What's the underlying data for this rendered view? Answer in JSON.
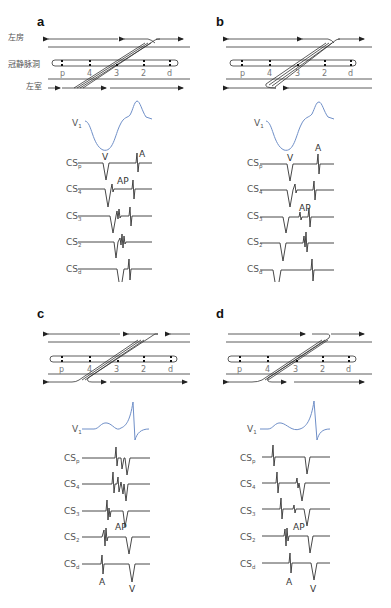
{
  "colors": {
    "v1_trace": "#6f8fc8",
    "trace": "#333333",
    "line": "#555555",
    "label": "#555555"
  },
  "anatomy_labels": {
    "left_atrium": "左房",
    "coronary_sinus": "冠静脉洞",
    "left_ventricle": "左室"
  },
  "electrodes": [
    "p",
    "4",
    "3",
    "2",
    "d"
  ],
  "trace_labels": [
    {
      "main": "V",
      "sub": "1"
    },
    {
      "main": "CS",
      "sub": "p"
    },
    {
      "main": "CS",
      "sub": "4"
    },
    {
      "main": "CS",
      "sub": "3"
    },
    {
      "main": "CS",
      "sub": "2"
    },
    {
      "main": "CS",
      "sub": "d"
    }
  ],
  "wave_labels": {
    "v": "V",
    "a": "A",
    "ap": "AP"
  },
  "panels": [
    {
      "letter": "a",
      "description": "Left free wall accessory pathway, retrograde conduction (ventricle to atrium), earliest atrial activation near CS3/CS2"
    },
    {
      "letter": "b",
      "description": "Left free wall accessory pathway, retrograde conduction, earliest atrial activation at CS2"
    },
    {
      "letter": "c",
      "description": "Left free wall accessory pathway, antegrade conduction (atrium to ventricle) with pre-excitation, CS distal pacing"
    },
    {
      "letter": "d",
      "description": "Left free wall accessory pathway, antegrade conduction with pre-excitation, atrial activation proximal to distal"
    }
  ]
}
